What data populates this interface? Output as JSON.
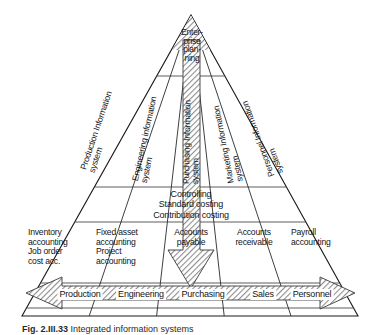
{
  "figure": {
    "type": "pyramid-diagram",
    "apex": {
      "lines": [
        "Enter-",
        "prise",
        "plan-",
        "ning"
      ],
      "full_text": "Enterprise planning"
    },
    "information_systems": [
      {
        "id": "production",
        "line1": "Production Information",
        "line2": "system"
      },
      {
        "id": "engineering",
        "line1": "Engineering information",
        "line2": "system"
      },
      {
        "id": "purchasing",
        "line1": "Purchasing Information",
        "line2": "system"
      },
      {
        "id": "marketing",
        "line1": "Marketing Information",
        "line2": "system"
      },
      {
        "id": "personnel",
        "line1": "Personnel Information",
        "line2": "system"
      }
    ],
    "controlling_band": {
      "lines": [
        "Controlling",
        "Standard costing",
        "Contribution costing"
      ]
    },
    "accounting_cells": [
      {
        "id": "inventory",
        "lines": [
          "Inventory",
          "accounting",
          "Job order",
          "cost acc."
        ]
      },
      {
        "id": "fixed-asset",
        "lines": [
          "Fixed asset",
          "accounting",
          "Project",
          "accounting"
        ]
      },
      {
        "id": "accounts-payable",
        "lines": [
          "Accounts",
          "payable"
        ]
      },
      {
        "id": "accounts-receivable",
        "lines": [
          "Accounts",
          "receivable"
        ]
      },
      {
        "id": "payroll",
        "lines": [
          "Payroll",
          "accounting"
        ]
      }
    ],
    "base_bar": {
      "segments": [
        "Production",
        "Engineering",
        "Purchasing",
        "Sales",
        "Personnel"
      ],
      "arrow_direction": "both"
    },
    "vertical_arrow": {
      "direction": "down",
      "from": "Enterprise planning",
      "to": "Accounts payable"
    },
    "caption": {
      "label": "Fig. 2.III.33",
      "text": "Integrated information systems"
    },
    "colors": {
      "line": "#1a1a1a",
      "hatch": "#8d8d8d",
      "background": "#ffffff",
      "text": "#141414"
    }
  }
}
